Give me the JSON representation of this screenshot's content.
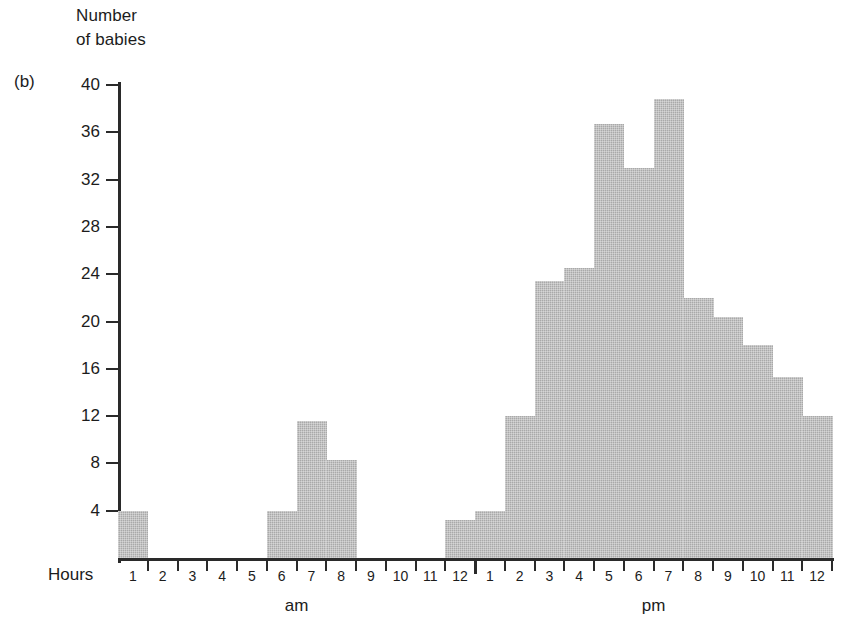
{
  "panel_letter": "(b)",
  "axis_title": "Number\nof babies",
  "hours_label": "Hours",
  "chart_data": {
    "type": "bar",
    "title": "Number of babies",
    "xlabel": "Hours",
    "ylabel": "Number of babies",
    "ylim": [
      0,
      42
    ],
    "yticks": [
      4,
      8,
      12,
      16,
      20,
      24,
      28,
      32,
      36,
      40
    ],
    "grid": false,
    "legend": null,
    "period_labels": [
      "am",
      "pm"
    ],
    "categories": [
      "1 am",
      "2 am",
      "3 am",
      "4 am",
      "5 am",
      "6 am",
      "7 am",
      "8 am",
      "9 am",
      "10 am",
      "11 am",
      "12 am",
      "1 pm",
      "2 pm",
      "3 pm",
      "4 pm",
      "5 pm",
      "6 pm",
      "7 pm",
      "8 pm",
      "9 pm",
      "10 pm",
      "11 pm",
      "12 pm"
    ],
    "tick_labels": [
      "1",
      "2",
      "3",
      "4",
      "5",
      "6",
      "7",
      "8",
      "9",
      "10",
      "11",
      "12",
      "1",
      "2",
      "3",
      "4",
      "5",
      "6",
      "7",
      "8",
      "9",
      "10",
      "11",
      "12"
    ],
    "values": [
      4,
      0,
      0,
      0,
      0,
      4,
      11.6,
      8.3,
      0,
      0,
      0,
      3.2,
      4,
      12,
      23.4,
      24.5,
      36.7,
      33,
      38.8,
      22,
      20.4,
      18,
      15.3,
      12
    ]
  },
  "colors": {
    "bar_fill": "#a9a9a9",
    "axis": "#2a2a2a",
    "text": "#1c1c1c"
  }
}
